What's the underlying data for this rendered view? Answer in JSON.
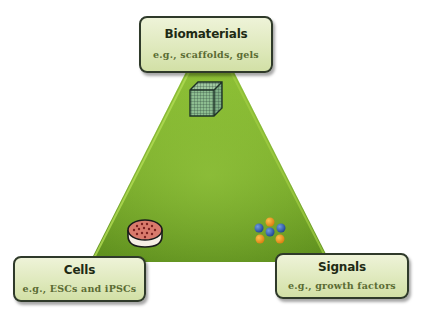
{
  "diagram": {
    "type": "triangle",
    "center_fill": "#7cad2c",
    "edge_highlight": "#a6d14a",
    "nodes": [
      {
        "id": "biomaterials",
        "title": "Biomaterials",
        "subtitle": "e.g., scaffolds, gels",
        "icon": "scaffold-cube-icon",
        "position": "top"
      },
      {
        "id": "cells",
        "title": "Cells",
        "subtitle": "e.g., ESCs and iPSCs",
        "icon": "petri-dish-icon",
        "position": "bottom-left"
      },
      {
        "id": "signals",
        "title": "Signals",
        "subtitle": "e.g., growth factors",
        "icon": "signal-molecules-icon",
        "position": "bottom-right"
      }
    ]
  },
  "colors": {
    "box_border": "#2f3a2a",
    "box_fill": "#dfe9bd",
    "title_text": "#1e2a14",
    "subtitle_text": "#5a6b33",
    "molecule_blue": "#2d5aa8",
    "molecule_orange": "#e8951f",
    "dish_red": "#c9605a"
  }
}
